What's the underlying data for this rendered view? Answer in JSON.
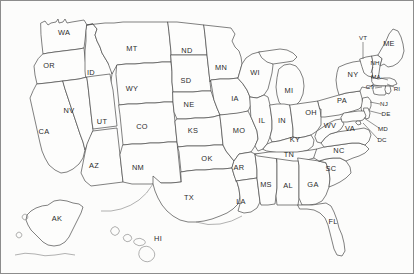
{
  "map": {
    "title": "United States Map",
    "background_color": "#fcfcfb",
    "border_color": "#8c8c8c",
    "outline_color": "#4a4a4a",
    "label_color": "#2b2b2b",
    "projection_note": "Contiguous United States with Alaska and Hawaii insets",
    "state_count": 50,
    "includes_dc": true
  },
  "states": [
    {
      "code": "WA",
      "name": "Washington",
      "x": 63,
      "y": 32,
      "small": false
    },
    {
      "code": "OR",
      "name": "Oregon",
      "x": 48,
      "y": 65,
      "small": false
    },
    {
      "code": "ID",
      "name": "Idaho",
      "x": 90,
      "y": 72,
      "small": false
    },
    {
      "code": "MT",
      "name": "Montana",
      "x": 131,
      "y": 48,
      "small": false
    },
    {
      "code": "ND",
      "name": "North Dakota",
      "x": 186,
      "y": 50,
      "small": false
    },
    {
      "code": "SD",
      "name": "South Dakota",
      "x": 185,
      "y": 80,
      "small": false
    },
    {
      "code": "MN",
      "name": "Minnesota",
      "x": 220,
      "y": 67,
      "small": false
    },
    {
      "code": "WI",
      "name": "Wisconsin",
      "x": 254,
      "y": 72,
      "small": false
    },
    {
      "code": "MI",
      "name": "Michigan",
      "x": 288,
      "y": 90,
      "small": false
    },
    {
      "code": "WY",
      "name": "Wyoming",
      "x": 131,
      "y": 88,
      "small": false
    },
    {
      "code": "NE",
      "name": "Nebraska",
      "x": 188,
      "y": 104,
      "small": false
    },
    {
      "code": "IA",
      "name": "Iowa",
      "x": 234,
      "y": 98,
      "small": false
    },
    {
      "code": "NV",
      "name": "Nevada",
      "x": 68,
      "y": 110,
      "small": false
    },
    {
      "code": "UT",
      "name": "Utah",
      "x": 101,
      "y": 121,
      "small": false
    },
    {
      "code": "CO",
      "name": "Colorado",
      "x": 141,
      "y": 126,
      "small": false
    },
    {
      "code": "KS",
      "name": "Kansas",
      "x": 192,
      "y": 130,
      "small": false
    },
    {
      "code": "MO",
      "name": "Missouri",
      "x": 238,
      "y": 130,
      "small": false
    },
    {
      "code": "IL",
      "name": "Illinois",
      "x": 261,
      "y": 120,
      "small": false
    },
    {
      "code": "IN",
      "name": "Indiana",
      "x": 281,
      "y": 120,
      "small": false
    },
    {
      "code": "OH",
      "name": "Ohio",
      "x": 310,
      "y": 112,
      "small": false
    },
    {
      "code": "KY",
      "name": "Kentucky",
      "x": 294,
      "y": 139,
      "small": false
    },
    {
      "code": "CA",
      "name": "California",
      "x": 43,
      "y": 131,
      "small": false
    },
    {
      "code": "AZ",
      "name": "Arizona",
      "x": 93,
      "y": 165,
      "small": false
    },
    {
      "code": "NM",
      "name": "New Mexico",
      "x": 137,
      "y": 167,
      "small": false
    },
    {
      "code": "OK",
      "name": "Oklahoma",
      "x": 206,
      "y": 158,
      "small": false
    },
    {
      "code": "AR",
      "name": "Arkansas",
      "x": 238,
      "y": 167,
      "small": false
    },
    {
      "code": "TN",
      "name": "Tennessee",
      "x": 288,
      "y": 154,
      "small": false
    },
    {
      "code": "TX",
      "name": "Texas",
      "x": 188,
      "y": 197,
      "small": false
    },
    {
      "code": "LA",
      "name": "Louisiana",
      "x": 240,
      "y": 201,
      "small": false
    },
    {
      "code": "MS",
      "name": "Mississippi",
      "x": 265,
      "y": 184,
      "small": false
    },
    {
      "code": "AL",
      "name": "Alabama",
      "x": 287,
      "y": 185,
      "small": false
    },
    {
      "code": "GA",
      "name": "Georgia",
      "x": 312,
      "y": 184,
      "small": false
    },
    {
      "code": "FL",
      "name": "Florida",
      "x": 332,
      "y": 221,
      "small": false
    },
    {
      "code": "SC",
      "name": "South Carolina",
      "x": 330,
      "y": 168,
      "small": false
    },
    {
      "code": "NC",
      "name": "North Carolina",
      "x": 338,
      "y": 150,
      "small": false
    },
    {
      "code": "VA",
      "name": "Virginia",
      "x": 349,
      "y": 128,
      "small": false
    },
    {
      "code": "WV",
      "name": "West Virginia",
      "x": 329,
      "y": 125,
      "small": false
    },
    {
      "code": "PA",
      "name": "Pennsylvania",
      "x": 341,
      "y": 100,
      "small": false
    },
    {
      "code": "NY",
      "name": "New York",
      "x": 352,
      "y": 74,
      "small": false
    },
    {
      "code": "VT",
      "name": "Vermont",
      "x": 362,
      "y": 37,
      "small": true
    },
    {
      "code": "ME",
      "name": "Maine",
      "x": 388,
      "y": 43,
      "small": false
    },
    {
      "code": "NH",
      "name": "New Hampshire",
      "x": 374,
      "y": 62,
      "small": true
    },
    {
      "code": "MA",
      "name": "Massachusetts",
      "x": 375,
      "y": 76,
      "small": true
    },
    {
      "code": "CT",
      "name": "Connecticut",
      "x": 369,
      "y": 86,
      "small": true
    },
    {
      "code": "RI",
      "name": "Rhode Island",
      "x": 396,
      "y": 88,
      "small": true
    },
    {
      "code": "NJ",
      "name": "New Jersey",
      "x": 383,
      "y": 103,
      "small": true
    },
    {
      "code": "DE",
      "name": "Delaware",
      "x": 385,
      "y": 113,
      "small": true
    },
    {
      "code": "MD",
      "name": "Maryland",
      "x": 382,
      "y": 128,
      "small": true
    },
    {
      "code": "DC",
      "name": "District of Columbia",
      "x": 381,
      "y": 139,
      "small": true
    },
    {
      "code": "AK",
      "name": "Alaska",
      "x": 56,
      "y": 218,
      "small": false
    },
    {
      "code": "HI",
      "name": "Hawaii",
      "x": 157,
      "y": 238,
      "small": false
    }
  ],
  "leader_lines": [
    {
      "label": "VT",
      "x1": 362,
      "y1": 41,
      "x2": 362,
      "y2": 58
    },
    {
      "label": "NH",
      "x1": 372,
      "y1": 66,
      "x2": 370,
      "y2": 72
    },
    {
      "label": "MA",
      "x1": 380,
      "y1": 77,
      "x2": 387,
      "y2": 79
    },
    {
      "label": "RI",
      "x1": 393,
      "y1": 86,
      "x2": 386,
      "y2": 83
    },
    {
      "label": "CT",
      "x1": 374,
      "y1": 87,
      "x2": 381,
      "y2": 86
    },
    {
      "label": "NJ",
      "x1": 379,
      "y1": 103,
      "x2": 369,
      "y2": 101
    },
    {
      "label": "DE",
      "x1": 381,
      "y1": 113,
      "x2": 369,
      "y2": 110
    },
    {
      "label": "MD",
      "x1": 378,
      "y1": 127,
      "x2": 363,
      "y2": 117
    },
    {
      "label": "DC",
      "x1": 377,
      "y1": 138,
      "x2": 362,
      "y2": 122
    }
  ]
}
